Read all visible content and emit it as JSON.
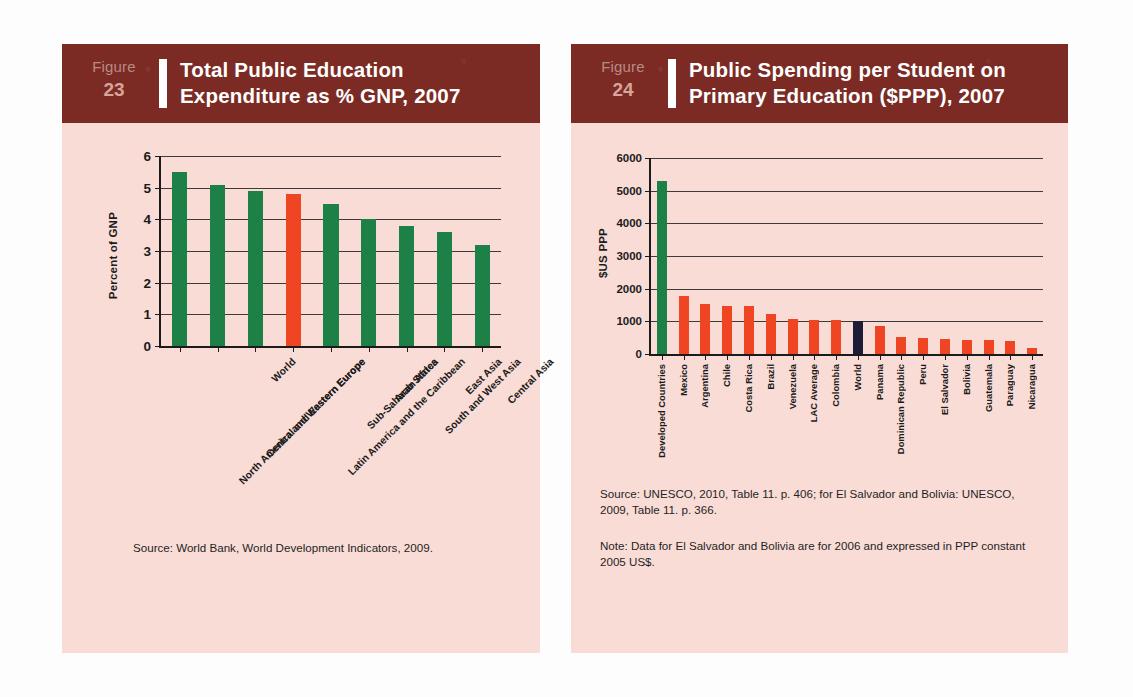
{
  "figures": [
    {
      "fig_word": "Figure",
      "fig_number": "23",
      "title_line1": "Total Public Education",
      "title_line2": "Expenditure as % GNP, 2007",
      "source": "Source: World Bank, World Development Indicators, 2009."
    },
    {
      "fig_word": "Figure",
      "fig_number": "24",
      "title_line1": "Public Spending per Student on",
      "title_line2": "Primary Education ($PPP), 2007",
      "source": "Source: UNESCO, 2010, Table 11. p. 406; for El Salvador and Bolivia: UNESCO, 2009, Table 11. p. 366.",
      "note": "Note: Data for El Salvador and Bolivia are for 2006 and expressed in PPP constant 2005 US$."
    }
  ],
  "colors": {
    "header_maroon": "#7b2b24",
    "panel_bg": "#f9dcd6",
    "bar_green": "#1d8046",
    "bar_red": "#f04522",
    "bar_navy": "#1c1c36",
    "axis": "#1b1b1b"
  },
  "chart_data": [
    {
      "type": "bar",
      "title": "Total Public Education Expenditure as % GNP, 2007",
      "xlabel": "",
      "ylabel": "Percent of GNP",
      "ylim": [
        0,
        6
      ],
      "yticks": [
        "0",
        "1",
        "2",
        "3",
        "4",
        "5",
        "6"
      ],
      "grid": true,
      "legend": "none",
      "categories": [
        "North America and Western Europe",
        "Central and Eastern Europe",
        "World",
        "Latin America and the Caribbean",
        "Sub-Saharan Africa",
        "Arab States",
        "South and West Asia",
        "East Asia",
        "Central Asia"
      ],
      "values": [
        5.5,
        5.1,
        4.9,
        4.8,
        4.5,
        4.0,
        3.8,
        3.6,
        3.2
      ],
      "bar_colors": [
        "#1d8046",
        "#1d8046",
        "#1d8046",
        "#f04522",
        "#1d8046",
        "#1d8046",
        "#1d8046",
        "#1d8046",
        "#1d8046"
      ]
    },
    {
      "type": "bar",
      "title": "Public Spending per Student on Primary Education ($PPP), 2007",
      "xlabel": "",
      "ylabel": "$US PPP",
      "ylim": [
        0,
        6000
      ],
      "yticks": [
        "0",
        "1000",
        "2000",
        "3000",
        "4000",
        "5000",
        "6000"
      ],
      "grid": true,
      "legend": "none",
      "categories": [
        "Developed Countries",
        "Mexico",
        "Argentina",
        "Chile",
        "Costa Rica",
        "Brazil",
        "Venezuela",
        "LAC Average",
        "Colombia",
        "World",
        "Panama",
        "Dominican Republic",
        "Peru",
        "El Salvador",
        "Bolivia",
        "Guatemala",
        "Paraguay",
        "Nicaragua"
      ],
      "values": [
        5300,
        1780,
        1520,
        1480,
        1460,
        1230,
        1060,
        1050,
        1030,
        1000,
        870,
        530,
        480,
        450,
        430,
        420,
        410,
        190
      ],
      "bar_colors": [
        "#1d8046",
        "#f04522",
        "#f04522",
        "#f04522",
        "#f04522",
        "#f04522",
        "#f04522",
        "#f04522",
        "#f04522",
        "#1c1c36",
        "#f04522",
        "#f04522",
        "#f04522",
        "#f04522",
        "#f04522",
        "#f04522",
        "#f04522",
        "#f04522"
      ]
    }
  ]
}
